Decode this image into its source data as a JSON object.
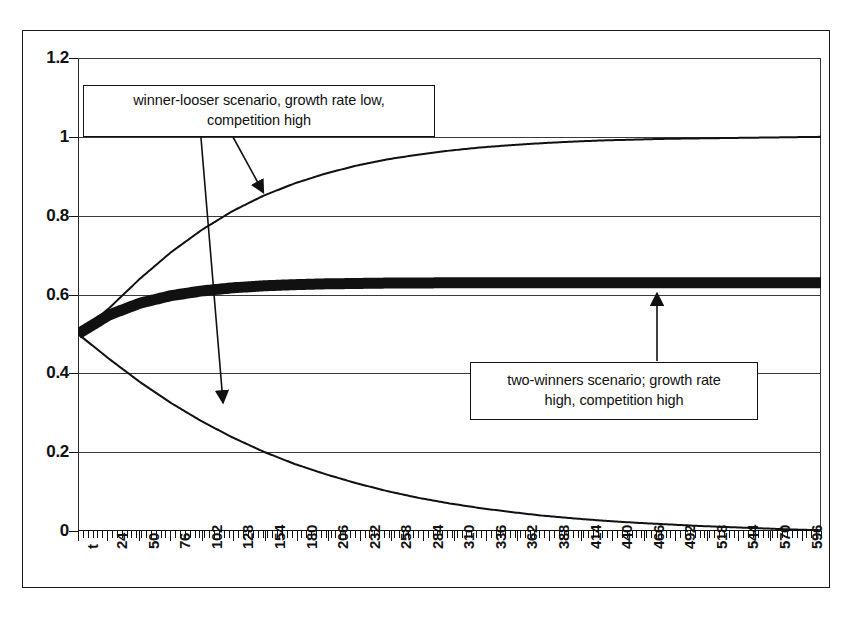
{
  "chart_data": {
    "type": "line",
    "title": "",
    "xlabel": "t",
    "ylabel": "",
    "ylim": [
      0,
      1.2
    ],
    "xlim": [
      0,
      612
    ],
    "grid": true,
    "legend_position": "none",
    "y_ticks": [
      "0",
      "0.2",
      "0.4",
      "0.6",
      "0.8",
      "1",
      "1.2"
    ],
    "y_tick_values": [
      0,
      0.2,
      0.4,
      0.6,
      0.8,
      1,
      1.2
    ],
    "x_ticks": [
      "t",
      "24",
      "50",
      "76",
      "102",
      "128",
      "154",
      "180",
      "206",
      "232",
      "258",
      "284",
      "310",
      "336",
      "362",
      "388",
      "414",
      "440",
      "466",
      "492",
      "518",
      "544",
      "570",
      "596"
    ],
    "x_tick_values": [
      0,
      24,
      50,
      76,
      102,
      128,
      154,
      180,
      206,
      232,
      258,
      284,
      310,
      336,
      362,
      388,
      414,
      440,
      466,
      492,
      518,
      544,
      570,
      596
    ],
    "series": [
      {
        "name": "two-winners (thick band)",
        "style": "thick-solid",
        "start_value": 0.5,
        "asymptote": 0.63,
        "values": [
          0.5,
          0.548,
          0.578,
          0.597,
          0.609,
          0.617,
          0.622,
          0.625,
          0.627,
          0.628,
          0.629,
          0.629,
          0.63,
          0.63,
          0.63,
          0.63,
          0.63,
          0.63,
          0.63,
          0.63,
          0.63,
          0.63,
          0.63,
          0.63,
          0.63
        ]
      },
      {
        "name": "winner (rising thin curve)",
        "style": "thin-solid",
        "start_value": 0.5,
        "asymptote": 1.0,
        "values": [
          0.5,
          0.565,
          0.64,
          0.707,
          0.764,
          0.812,
          0.851,
          0.882,
          0.907,
          0.927,
          0.943,
          0.955,
          0.965,
          0.973,
          0.979,
          0.984,
          0.988,
          0.991,
          0.993,
          0.995,
          0.996,
          0.997,
          0.998,
          0.999,
          1.0
        ]
      },
      {
        "name": "looser (falling thin curve)",
        "style": "thin-solid",
        "start_value": 0.5,
        "asymptote": 0.0,
        "values": [
          0.5,
          0.437,
          0.378,
          0.325,
          0.278,
          0.237,
          0.201,
          0.17,
          0.144,
          0.121,
          0.101,
          0.084,
          0.07,
          0.058,
          0.048,
          0.039,
          0.032,
          0.026,
          0.021,
          0.017,
          0.013,
          0.01,
          0.007,
          0.004,
          0.002
        ]
      }
    ],
    "annotations": [
      {
        "id": "winner-looser",
        "text_line1": "winner-looser scenario, growth rate low,",
        "text_line2": "competition high",
        "points_to": [
          "rising-curve",
          "falling-curve"
        ]
      },
      {
        "id": "two-winners",
        "text_line1": "two-winners scenario; growth rate",
        "text_line2": "high, competition high",
        "points_to": [
          "thick-band"
        ]
      }
    ],
    "colors": {
      "line": "#111111",
      "grid": "#3a3a3a",
      "background": "#ffffff"
    }
  }
}
